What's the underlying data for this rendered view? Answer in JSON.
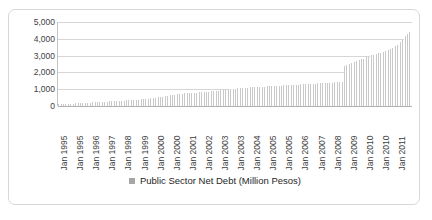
{
  "chart_data": {
    "type": "bar",
    "title": "",
    "xlabel": "",
    "ylabel": "",
    "ylim": [
      0,
      5000
    ],
    "ytick_labels": [
      "5,000",
      "4,000",
      "3,000",
      "2,000",
      "1,000",
      "0"
    ],
    "ytick_values": [
      5000,
      4000,
      3000,
      2000,
      1000,
      0
    ],
    "grid": true,
    "legend_position": "bottom",
    "series": [
      {
        "name": "Public Sector Net Debt (Million Pesos)",
        "color": "#c9c9c9",
        "values": [
          95,
          100,
          105,
          112,
          118,
          124,
          130,
          136,
          142,
          148,
          154,
          160,
          165,
          170,
          176,
          182,
          188,
          193,
          198,
          204,
          210,
          216,
          222,
          228,
          234,
          240,
          246,
          252,
          258,
          264,
          270,
          276,
          282,
          288,
          294,
          300,
          306,
          312,
          318,
          324,
          330,
          336,
          342,
          348,
          354,
          360,
          366,
          372,
          380,
          392,
          404,
          418,
          430,
          442,
          456,
          468,
          482,
          496,
          510,
          524,
          540,
          556,
          572,
          588,
          604,
          620,
          636,
          652,
          668,
          684,
          700,
          716,
          730,
          742,
          752,
          760,
          768,
          774,
          780,
          786,
          792,
          798,
          804,
          810,
          818,
          828,
          838,
          848,
          858,
          868,
          878,
          888,
          898,
          908,
          918,
          928,
          940,
          952,
          964,
          976,
          988,
          1000,
          1012,
          1024,
          1036,
          1048,
          1060,
          1072,
          1078,
          1084,
          1090,
          1096,
          1102,
          1108,
          1114,
          1120,
          1126,
          1132,
          1138,
          1144,
          1150,
          1156,
          1162,
          1168,
          1174,
          1180,
          1186,
          1192,
          1198,
          1204,
          1210,
          1216,
          1222,
          1228,
          1234,
          1240,
          1246,
          1252,
          1258,
          1264,
          1270,
          1276,
          1282,
          1288,
          1294,
          1300,
          1306,
          1312,
          1318,
          1324,
          1330,
          1336,
          1342,
          1348,
          1354,
          1360,
          1366,
          1372,
          1378,
          1384,
          1390,
          1396,
          1402,
          1408,
          1414,
          1420,
          1426,
          1432,
          2380,
          2420,
          2460,
          2500,
          2540,
          2580,
          2620,
          2660,
          2700,
          2740,
          2780,
          2820,
          2860,
          2900,
          2940,
          2980,
          3010,
          3040,
          3070,
          3100,
          3130,
          3160,
          3190,
          3220,
          3250,
          3290,
          3330,
          3380,
          3430,
          3490,
          3560,
          3640,
          3730,
          3830,
          3940,
          4060,
          4180,
          4300,
          4420,
          4500
        ]
      }
    ],
    "xtick_labels": [
      "Jan 1995",
      "Jan 1995",
      "Jan 1996",
      "Jan 1997",
      "Jan 1998",
      "Jan 1999",
      "Jan 2000",
      "Jan 2000",
      "Jan 2001",
      "Jan 2002",
      "Jan 2003",
      "Jan 2003",
      "Jan 2004",
      "Jan 2005",
      "Jan 2005",
      "Jan 2006",
      "Jan 2007",
      "Jan 2008",
      "Jan 2009",
      "Jan 2010",
      "Jan 2010",
      "Jan 2011"
    ]
  },
  "legend": {
    "label": "Public Sector Net Debt (Million Pesos)",
    "swatch_color": "#a6a6a6"
  }
}
